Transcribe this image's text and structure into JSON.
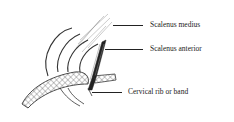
{
  "figure": {
    "labels": [
      {
        "id": "scalenus-medius",
        "text": "Scalenus medius"
      },
      {
        "id": "scalenus-anterior",
        "text": "Scalenus anterior"
      },
      {
        "id": "cervical-rib",
        "text": "Cervical rib or band"
      }
    ]
  },
  "colors": {
    "ink": "#222222",
    "background": "#ffffff"
  }
}
